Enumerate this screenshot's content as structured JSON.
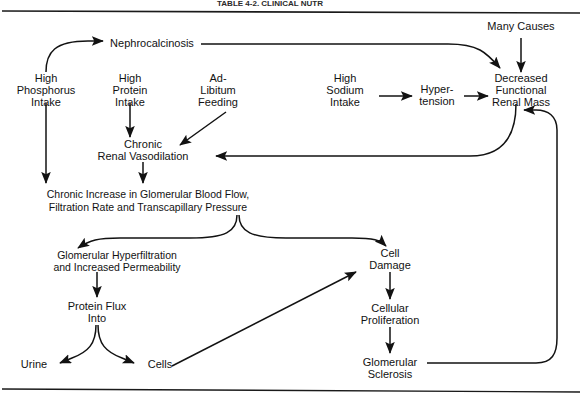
{
  "figure": {
    "header_partial": "TABLE 4-2. CLINICAL NUTR",
    "frame": {
      "top_rule_y": 11,
      "bottom_rule_y": 390,
      "color": "#1a1a1a"
    }
  },
  "nodes": {
    "nephrocalcinosis": {
      "label": "Nephrocalcinosis",
      "x": 152,
      "y": 47
    },
    "many_causes": {
      "label": "Many Causes",
      "x": 521,
      "y": 30
    },
    "high_phosphorus": {
      "line1": "High",
      "line2": "Phosphorus",
      "line3": "Intake",
      "x": 46,
      "y": 92
    },
    "high_protein": {
      "line1": "High",
      "line2": "Protein",
      "line3": "Intake",
      "x": 130,
      "y": 92
    },
    "ad_libitum": {
      "line1": "Ad-",
      "line2": "Libitum",
      "line3": "Feeding",
      "x": 218,
      "y": 92
    },
    "high_sodium": {
      "line1": "High",
      "line2": "Sodium",
      "line3": "Intake",
      "x": 345,
      "y": 92
    },
    "hypertension": {
      "line1": "Hyper-",
      "line2": "tension",
      "x": 437,
      "y": 99
    },
    "decreased_renal_mass": {
      "line1": "Decreased",
      "line2": "Functional",
      "line3": "Renal Mass",
      "x": 521,
      "y": 92
    },
    "chronic_vasodilation": {
      "line1": "Chronic",
      "line2": "Renal Vasodilation",
      "x": 143,
      "y": 152
    },
    "chronic_increase": {
      "line1": "Chronic Increase in Glomerular Blood Flow,",
      "line2": "Filtration Rate and Transcapillary Pressure",
      "x": 148,
      "y": 201
    },
    "glomerular_hyperfiltration": {
      "line1": "Glomerular Hyperfiltration",
      "line2": "and Increased Permeability",
      "x": 117,
      "y": 261
    },
    "protein_flux": {
      "line1": "Protein Flux",
      "line2": "Into",
      "x": 97,
      "y": 313
    },
    "urine": {
      "label": "Urine",
      "x": 34,
      "y": 368
    },
    "cells": {
      "label": "Cells",
      "x": 160,
      "y": 368
    },
    "cell_damage": {
      "line1": "Cell",
      "line2": "Damage",
      "x": 390,
      "y": 259
    },
    "cellular_proliferation": {
      "line1": "Cellular",
      "line2": "Proliferation",
      "x": 390,
      "y": 314
    },
    "glomerular_sclerosis": {
      "line1": "Glomerular",
      "line2": "Sclerosis",
      "x": 390,
      "y": 368
    }
  },
  "edges": [
    {
      "name": "phosphorus-to-nephrocalcinosis",
      "from": "high_phosphorus",
      "to": "nephrocalcinosis"
    },
    {
      "name": "nephrocalcinosis-to-renal-mass",
      "from": "nephrocalcinosis",
      "to": "decreased_renal_mass"
    },
    {
      "name": "many-causes-to-renal-mass",
      "from": "many_causes",
      "to": "decreased_renal_mass"
    },
    {
      "name": "phosphorus-to-chronic-increase",
      "from": "high_phosphorus",
      "to": "chronic_increase"
    },
    {
      "name": "protein-to-vasodilation",
      "from": "high_protein",
      "to": "chronic_vasodilation"
    },
    {
      "name": "adlibitum-to-vasodilation",
      "from": "ad_libitum",
      "to": "chronic_vasodilation"
    },
    {
      "name": "sodium-to-hypertension",
      "from": "high_sodium",
      "to": "hypertension"
    },
    {
      "name": "hypertension-to-renal-mass",
      "from": "hypertension",
      "to": "decreased_renal_mass"
    },
    {
      "name": "renal-mass-to-vasodilation",
      "from": "decreased_renal_mass",
      "to": "chronic_vasodilation"
    },
    {
      "name": "vasodilation-to-chronic-increase",
      "from": "chronic_vasodilation",
      "to": "chronic_increase"
    },
    {
      "name": "chronic-increase-to-hyperfiltration",
      "from": "chronic_increase",
      "to": "glomerular_hyperfiltration"
    },
    {
      "name": "chronic-increase-to-cell-damage",
      "from": "chronic_increase",
      "to": "cell_damage"
    },
    {
      "name": "hyperfiltration-to-protein-flux",
      "from": "glomerular_hyperfiltration",
      "to": "protein_flux"
    },
    {
      "name": "protein-flux-to-urine",
      "from": "protein_flux",
      "to": "urine"
    },
    {
      "name": "protein-flux-to-cells",
      "from": "protein_flux",
      "to": "cells"
    },
    {
      "name": "cells-to-cell-damage",
      "from": "cells",
      "to": "cell_damage"
    },
    {
      "name": "cell-damage-to-proliferation",
      "from": "cell_damage",
      "to": "cellular_proliferation"
    },
    {
      "name": "proliferation-to-sclerosis",
      "from": "cellular_proliferation",
      "to": "glomerular_sclerosis"
    },
    {
      "name": "sclerosis-to-renal-mass",
      "from": "glomerular_sclerosis",
      "to": "decreased_renal_mass"
    }
  ]
}
